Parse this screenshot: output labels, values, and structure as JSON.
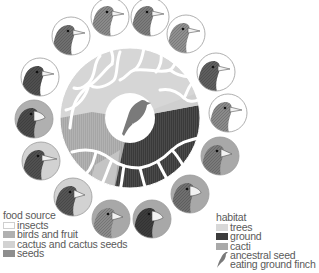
{
  "colors": {
    "insects": "#ffffff",
    "birds_and_fruit": "#b0b0b0",
    "cactus_and_cactus_seeds": "#d2d2d2",
    "seeds": "#8e8e8e",
    "trees": "#d8d8d8",
    "ground": "#3c3c3c",
    "cacti": "#a9a9a9",
    "wheel_light": "#d6d6d6",
    "wheel_mid": "#b6b6b6",
    "ancestral_finch": "#7a7a7a"
  },
  "food_legend": {
    "title": "food source",
    "items": [
      {
        "label": "insects",
        "key": "insects"
      },
      {
        "label": "birds and fruit",
        "key": "birds_and_fruit"
      },
      {
        "label": "cactus and cactus seeds",
        "key": "cactus_and_cactus_seeds"
      },
      {
        "label": "seeds",
        "key": "seeds"
      }
    ]
  },
  "habitat_legend": {
    "title": "habitat",
    "items": [
      {
        "label": "trees",
        "key": "trees"
      },
      {
        "label": "ground",
        "key": "ground"
      },
      {
        "label": "cacti",
        "key": "cacti"
      }
    ],
    "ancestor": {
      "line1": "ancestral seed",
      "line2": "eating ground finch"
    }
  },
  "finch_portraits": [
    {
      "cx": 110,
      "cy": 17,
      "bg": "#ffffff",
      "head": "#8a8a8a",
      "beak": "slender"
    },
    {
      "cx": 150,
      "cy": 17,
      "bg": "#ffffff",
      "head": "#7c7c7c",
      "beak": "slender"
    },
    {
      "cx": 186,
      "cy": 34,
      "bg": "#ffffff",
      "head": "#8f8f8f",
      "beak": "slender"
    },
    {
      "cx": 216,
      "cy": 72,
      "bg": "#ffffff",
      "head": "#5e5e5e",
      "beak": "slender"
    },
    {
      "cx": 228,
      "cy": 113,
      "bg": "#ffffff",
      "head": "#8a8a8a",
      "beak": "slender"
    },
    {
      "cx": 220,
      "cy": 156,
      "bg": "#a8a8a8",
      "head": "#7a7a7a",
      "beak": "medium"
    },
    {
      "cx": 190,
      "cy": 194,
      "bg": "#a8a8a8",
      "head": "#6f6f6f",
      "beak": "thick"
    },
    {
      "cx": 152,
      "cy": 219,
      "bg": "#a8a8a8",
      "head": "#3c3c3c",
      "beak": "thick"
    },
    {
      "cx": 111,
      "cy": 219,
      "bg": "#a8a8a8",
      "head": "#8a8a8a",
      "beak": "medium"
    },
    {
      "cx": 73,
      "cy": 197,
      "bg": "#d2d2d2",
      "head": "#555555",
      "beak": "medium"
    },
    {
      "cx": 41,
      "cy": 161,
      "bg": "#d2d2d2",
      "head": "#505050",
      "beak": "long"
    },
    {
      "cx": 34,
      "cy": 119,
      "bg": "#b0b0b0",
      "head": "#4a4a4a",
      "beak": "thick"
    },
    {
      "cx": 40,
      "cy": 77,
      "bg": "#ffffff",
      "head": "#4f4f4f",
      "beak": "slender"
    },
    {
      "cx": 71,
      "cy": 36,
      "bg": "#ffffff",
      "head": "#6f6f6f",
      "beak": "slender"
    }
  ],
  "wheel": {
    "cx": 130,
    "cy": 118,
    "outer_r": 70,
    "inner_r": 25
  }
}
